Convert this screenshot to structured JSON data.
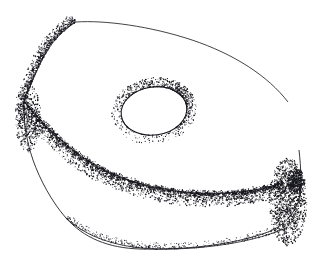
{
  "figure": {
    "domain": "natural-image",
    "kind": "stippled-pen-and-ink-illustration",
    "title": "",
    "caption": "",
    "labels": [],
    "background_color": "#ffffff",
    "ink_color": "#15151c",
    "canvas": {
      "width": 315,
      "height": 262
    }
  },
  "geometry": {
    "top_face_outline": "M 76 22 C 100 19, 140 22, 180 32 C 220 42, 258 62, 281 88 C 296 105, 302 128, 299 150 C 297 166, 290 176, 283 182 C 268 193, 236 197, 200 196 C 160 195, 120 189, 92 177 C 74 169, 60 157, 52 144 C 44 131, 40 120, 35 110 C 31 102, 26 98, 24 100 C 26 84, 34 64, 46 48 C 56 35, 66 26, 76 22 Z",
    "top_face_highlight_edge": "M 76 22 C 104 20, 150 26, 192 40 C 234 54, 268 76, 288 102",
    "left_upper_edge": "M 76 22 C 62 30, 50 44, 42 60 C 34 76, 28 92, 24 101",
    "ridge_line": "M 24 101 C 38 118, 58 140, 84 158 C 110 176, 146 188, 184 192 C 222 196, 262 191, 283 182",
    "lower_silhouette": "M 24 101 C 23 118, 26 140, 33 160 C 40 180, 52 202, 66 218 C 84 238, 108 248, 140 249 C 180 250, 230 246, 268 232 C 284 226, 294 214, 299 200 C 302 186, 301 168, 299 150",
    "right_corner_vertex": {
      "x": 299,
      "y": 181
    },
    "left_corner_vertex": {
      "x": 24,
      "y": 101
    },
    "top_apex_vertex": {
      "x": 76,
      "y": 22
    },
    "bottom_edge_curve": "M 66 218 C 92 242, 130 250, 172 249 C 214 248, 256 241, 286 228",
    "hole": {
      "cx": 154,
      "cy": 111,
      "rx": 33,
      "ry": 24,
      "rotation_deg": -8
    }
  },
  "stipple": {
    "dot_color": "#15151c",
    "regions": [
      {
        "name": "top-left-rim",
        "count": 900,
        "along": "left_upper_edge",
        "spread": 9,
        "bias": "inward",
        "min_r": 0.32,
        "max_r": 0.72
      },
      {
        "name": "left-corner-cluster",
        "count": 700,
        "cx": 28,
        "cy": 118,
        "rx": 13,
        "ry": 34,
        "min_r": 0.32,
        "max_r": 0.8
      },
      {
        "name": "ridge-shadow",
        "count": 2600,
        "along": "ridge_line",
        "spread": 13,
        "bias": "below",
        "min_r": 0.3,
        "max_r": 0.78
      },
      {
        "name": "ridge-core-dark",
        "count": 1300,
        "along": "ridge_line",
        "spread": 3.2,
        "bias": "center",
        "min_r": 0.34,
        "max_r": 0.72
      },
      {
        "name": "right-face",
        "count": 1700,
        "cx": 288,
        "cy": 202,
        "rx": 19,
        "ry": 44,
        "min_r": 0.3,
        "max_r": 0.8
      },
      {
        "name": "right-corner-dark",
        "count": 520,
        "cx": 296,
        "cy": 182,
        "rx": 9,
        "ry": 13,
        "min_r": 0.34,
        "max_r": 0.84
      },
      {
        "name": "bottom-left-rim",
        "count": 560,
        "along": "bottom_edge_curve",
        "spread": 6,
        "bias": "above",
        "min_r": 0.28,
        "max_r": 0.62
      },
      {
        "name": "hole-rim",
        "count": 1500,
        "ellipse_ring": true,
        "min_r": 0.3,
        "max_r": 0.74
      }
    ]
  },
  "chart_data": null
}
